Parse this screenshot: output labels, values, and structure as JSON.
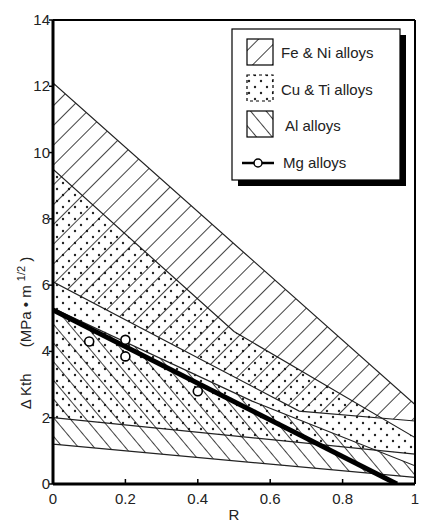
{
  "chart_data": {
    "type": "area",
    "title": "",
    "xlabel": "R",
    "ylabel": "Δ Kth   (MPa • m1/2)",
    "ylabel_main": "Δ Kth",
    "ylabel_unit": "(MPa • m",
    "ylabel_exp": "1/2",
    "ylabel_close": ")",
    "xlim": [
      0,
      1
    ],
    "ylim": [
      0,
      14
    ],
    "xticks": [
      0,
      0.2,
      0.4,
      0.6,
      0.8,
      1
    ],
    "xtick_labels": [
      "0",
      "0.2",
      "0.4",
      "0.6",
      "0.8",
      "1"
    ],
    "yticks": [
      0,
      2,
      4,
      6,
      8,
      10,
      12,
      14
    ],
    "ytick_labels": [
      "0",
      "2",
      "4",
      "6",
      "8",
      "10",
      "12",
      "14"
    ],
    "grid": false,
    "legend_position": "upper right",
    "series": [
      {
        "name": "Fe & Ni alloys",
        "kind": "band",
        "pattern": "backslash-hatch",
        "upper": [
          [
            0,
            12.1
          ],
          [
            1,
            2.4
          ]
        ],
        "lower": [
          [
            0,
            6.1
          ],
          [
            0.68,
            2.2
          ],
          [
            1,
            1.9
          ]
        ]
      },
      {
        "name": "Cu & Ti alloys",
        "kind": "band",
        "pattern": "dots",
        "upper": [
          [
            0,
            9.5
          ],
          [
            0.5,
            4.6
          ],
          [
            1,
            1.4
          ]
        ],
        "lower": [
          [
            0,
            2.0
          ],
          [
            1,
            0.9
          ]
        ]
      },
      {
        "name": "Al alloys",
        "kind": "band",
        "pattern": "slash-hatch",
        "upper": [
          [
            0,
            5.3
          ],
          [
            0.55,
            2.5
          ],
          [
            1,
            0.55
          ]
        ],
        "lower": [
          [
            0,
            1.2
          ],
          [
            1,
            0.2
          ]
        ]
      },
      {
        "name": "Mg alloys",
        "kind": "line-with-markers",
        "line": [
          [
            0,
            5.25
          ],
          [
            0.95,
            0
          ]
        ],
        "points": [
          [
            0.1,
            4.3
          ],
          [
            0.2,
            4.35
          ],
          [
            0.2,
            3.85
          ],
          [
            0.4,
            2.8
          ]
        ]
      }
    ]
  },
  "legend": {
    "items": [
      {
        "label": "Fe & Ni  alloys"
      },
      {
        "label": "Cu & Ti  alloys"
      },
      {
        "label": "Al  alloys"
      },
      {
        "label": "Mg  alloys"
      }
    ]
  }
}
